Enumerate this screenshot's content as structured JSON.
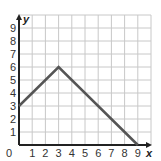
{
  "chart_data": {
    "type": "line",
    "title": "",
    "xlabel": "x",
    "ylabel": "y",
    "xlim": [
      0,
      10
    ],
    "ylim": [
      0,
      10
    ],
    "grid": true,
    "x_ticks": [
      "1",
      "2",
      "3",
      "4",
      "5",
      "6",
      "7",
      "8",
      "9"
    ],
    "y_ticks": [
      "1",
      "2",
      "3",
      "4",
      "5",
      "6",
      "7",
      "8",
      "9"
    ],
    "origin_label": "0",
    "series": [
      {
        "name": "line",
        "points": [
          [
            0,
            3
          ],
          [
            3,
            6
          ],
          [
            9,
            0
          ]
        ],
        "color": "#555555"
      }
    ]
  },
  "colors": {
    "grid": "#c8c8c8",
    "axis": "#222222",
    "line": "#555555"
  }
}
